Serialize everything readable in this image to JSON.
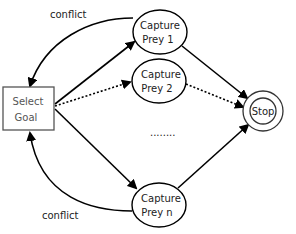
{
  "diagram": {
    "type": "state-flow",
    "nodes": [
      {
        "id": "select_goal",
        "shape": "rectangle",
        "label_line1": "Select",
        "label_line2": "Goal"
      },
      {
        "id": "capture_prey_1",
        "shape": "circle",
        "label_line1": "Capture",
        "label_line2": "Prey 1"
      },
      {
        "id": "capture_prey_2",
        "shape": "circle",
        "label_line1": "Capture",
        "label_line2": "Prey 2"
      },
      {
        "id": "capture_prey_n",
        "shape": "circle",
        "label_line1": "Capture",
        "label_line2": "Prey n"
      },
      {
        "id": "stop",
        "shape": "double-circle",
        "label": "Stop"
      }
    ],
    "edges": [
      {
        "from": "select_goal",
        "to": "capture_prey_1",
        "style": "solid"
      },
      {
        "from": "select_goal",
        "to": "capture_prey_2",
        "style": "dotted"
      },
      {
        "from": "select_goal",
        "to": "capture_prey_n",
        "style": "solid"
      },
      {
        "from": "capture_prey_1",
        "to": "stop",
        "style": "solid"
      },
      {
        "from": "capture_prey_2",
        "to": "stop",
        "style": "dotted"
      },
      {
        "from": "capture_prey_n",
        "to": "stop",
        "style": "solid"
      },
      {
        "from": "capture_prey_1",
        "to": "select_goal",
        "style": "solid-curved",
        "label": "conflict"
      },
      {
        "from": "capture_prey_n",
        "to": "select_goal",
        "style": "solid-curved",
        "label": "conflict"
      }
    ],
    "edge_labels": {
      "top_conflict": "conflict",
      "bottom_conflict": "conflict"
    },
    "ellipsis": "........"
  }
}
